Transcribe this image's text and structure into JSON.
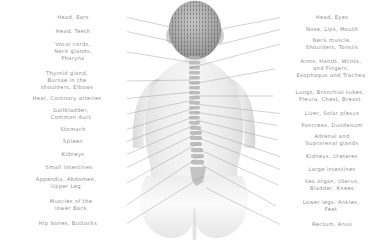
{
  "diagram": {
    "background_color": "#ffffff",
    "label_color": "#8e8e8e",
    "line_color": "#9a9a9a",
    "figure": {
      "name": "human-back-figure",
      "description": "grayscale rear view of a human upper body showing the spine"
    }
  },
  "left_labels": [
    {
      "text": "Head, Ears",
      "x": 20,
      "y": 14,
      "w": 106,
      "anchor_x": 184,
      "anchor_y": 30
    },
    {
      "text": "Head, Teeth",
      "x": 20,
      "y": 28,
      "w": 106,
      "anchor_x": 188,
      "anchor_y": 45
    },
    {
      "text": "Vocal cords,\nNeck glands,\nPharynx",
      "x": 20,
      "y": 41,
      "w": 106,
      "anchor_x": 190,
      "anchor_y": 62
    },
    {
      "text": "Thyroid gland,\nBursae in the\nshoulders, Elbows",
      "x": 8,
      "y": 70,
      "w": 118,
      "anchor_x": 191,
      "anchor_y": 80
    },
    {
      "text": "Hear, Coronary arteries",
      "x": 8,
      "y": 95,
      "w": 118,
      "anchor_x": 193,
      "anchor_y": 92
    },
    {
      "text": "Gallbladder,\nCommon duct",
      "x": 16,
      "y": 107,
      "w": 110,
      "anchor_x": 194,
      "anchor_y": 100
    },
    {
      "text": "Stomach",
      "x": 20,
      "y": 126,
      "w": 106,
      "anchor_x": 195,
      "anchor_y": 108
    },
    {
      "text": "Spleen",
      "x": 20,
      "y": 138,
      "w": 106,
      "anchor_x": 196,
      "anchor_y": 116
    },
    {
      "text": "Kidneys",
      "x": 20,
      "y": 151,
      "w": 106,
      "anchor_x": 197,
      "anchor_y": 124
    },
    {
      "text": "Small intestines",
      "x": 12,
      "y": 164,
      "w": 114,
      "anchor_x": 198,
      "anchor_y": 133
    },
    {
      "text": "Appendix, Abdomen,\nUpper Leg",
      "x": 6,
      "y": 176,
      "w": 120,
      "anchor_x": 199,
      "anchor_y": 143
    },
    {
      "text": "Muscles of the\nlower Back",
      "x": 16,
      "y": 198,
      "w": 110,
      "anchor_x": 200,
      "anchor_y": 156
    },
    {
      "text": "Hip bones, Buttocks",
      "x": 10,
      "y": 220,
      "w": 116,
      "anchor_x": 203,
      "anchor_y": 176
    }
  ],
  "right_labels": [
    {
      "text": "Head, Eyes",
      "x": 281,
      "y": 14,
      "w": 102,
      "anchor_x": 186,
      "anchor_y": 36
    },
    {
      "text": "Nose, Lips, Mouth",
      "x": 281,
      "y": 26,
      "w": 102,
      "anchor_x": 189,
      "anchor_y": 52
    },
    {
      "text": "Neck muscle,\nShoulders, Tonsils",
      "x": 281,
      "y": 37,
      "w": 102,
      "anchor_x": 190,
      "anchor_y": 68
    },
    {
      "text": "Arms, Hands, Wrists,\nand Fingers,\nEsophagus and Trachea",
      "x": 276,
      "y": 58,
      "w": 110,
      "anchor_x": 192,
      "anchor_y": 84
    },
    {
      "text": "Lungs, Bronchial tubes,\nPleura, Chest, Breast",
      "x": 274,
      "y": 89,
      "w": 112,
      "anchor_x": 193,
      "anchor_y": 96
    },
    {
      "text": "Liver, Solar plexus",
      "x": 281,
      "y": 110,
      "w": 102,
      "anchor_x": 194,
      "anchor_y": 104
    },
    {
      "text": "Pancreas, Duodenum",
      "x": 278,
      "y": 122,
      "w": 108,
      "anchor_x": 195,
      "anchor_y": 112
    },
    {
      "text": "Adrenal and\nSuprarenal glands",
      "x": 278,
      "y": 133,
      "w": 108,
      "anchor_x": 196,
      "anchor_y": 120
    },
    {
      "text": "Kidneys, Ureteres",
      "x": 281,
      "y": 153,
      "w": 102,
      "anchor_x": 197,
      "anchor_y": 129
    },
    {
      "text": "Large intestines",
      "x": 281,
      "y": 166,
      "w": 102,
      "anchor_x": 199,
      "anchor_y": 138
    },
    {
      "text": "Sex organ, Uterus,\nBladder, Knees",
      "x": 279,
      "y": 178,
      "w": 106,
      "anchor_x": 200,
      "anchor_y": 150
    },
    {
      "text": "Lower legs, Ankles,\nFeet",
      "x": 277,
      "y": 199,
      "w": 108,
      "anchor_x": 202,
      "anchor_y": 165
    },
    {
      "text": "Rectum, Anus",
      "x": 281,
      "y": 221,
      "w": 102,
      "anchor_x": 206,
      "anchor_y": 188
    }
  ]
}
